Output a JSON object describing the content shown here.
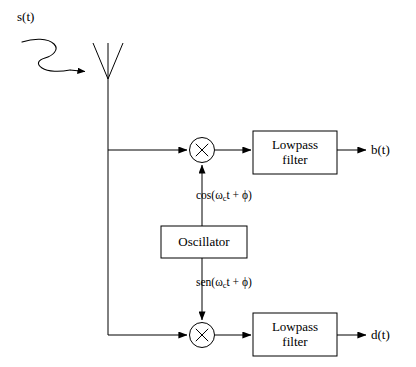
{
  "diagram": {
    "input_signal_label": "s(t)",
    "antenna_name": "receiving-antenna",
    "incoming_wave_name": "incoming-wave-arrow",
    "oscillator": {
      "label": "Oscillator"
    },
    "multipliers": [
      {
        "id": "mixer-i",
        "symbol": "×"
      },
      {
        "id": "mixer-q",
        "symbol": "×"
      }
    ],
    "carriers": {
      "in_phase": {
        "prefix": "cos(ω",
        "subscript": "c",
        "suffix": "t + ϕ)"
      },
      "quadrature": {
        "prefix": "sen(ω",
        "subscript": "c",
        "suffix": "t + ϕ)"
      }
    },
    "filters": [
      {
        "id": "lowpass-filter-i",
        "line1": "Lowpass",
        "line2": "filter"
      },
      {
        "id": "lowpass-filter-q",
        "line1": "Lowpass",
        "line2": "filter"
      }
    ],
    "outputs": [
      {
        "id": "output-b",
        "label": "b(t)"
      },
      {
        "id": "output-d",
        "label": "d(t)"
      }
    ],
    "colors": {
      "stroke": "#000000",
      "background": "#ffffff",
      "text": "#000000"
    }
  }
}
